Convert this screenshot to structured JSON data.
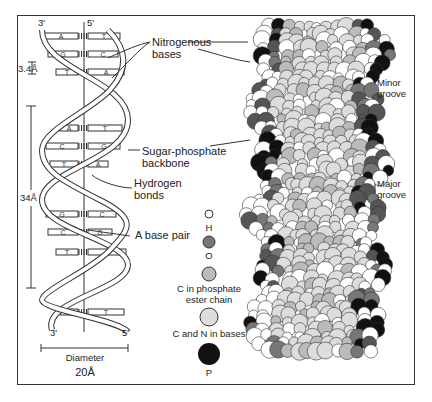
{
  "diagram": {
    "ladder_model": {
      "strand_ends_top": [
        "3'",
        "5'"
      ],
      "strand_ends_bottom": [
        "3'",
        "5'"
      ],
      "base_pairs": [
        {
          "left": "A",
          "right": "T"
        },
        {
          "left": "G",
          "right": "C"
        },
        {
          "left": "T",
          "right": "A"
        },
        {
          "left": "A",
          "right": "T"
        },
        {
          "left": "C",
          "right": "G"
        },
        {
          "left": "T",
          "right": "A"
        },
        {
          "left": "G",
          "right": "C"
        },
        {
          "left": "C",
          "right": "G"
        },
        {
          "left": "T",
          "right": "A"
        },
        {
          "left": "A",
          "right": "T"
        }
      ],
      "rise_label": "3.4Å",
      "pitch_label": "34Å",
      "diameter_label": "Diameter",
      "diameter_value": "20Å"
    },
    "callouts": {
      "nitrogenous_bases": "Nitrogenous bases",
      "nitrogenous_line1": "Nitrogenous",
      "nitrogenous_line2": "bases",
      "backbone_line1": "Sugar-phosphate",
      "backbone_line2": "backbone",
      "hbond_line1": "Hydrogen",
      "hbond_line2": "bonds",
      "base_pair": "A base pair"
    },
    "legend": [
      {
        "symbol": "H",
        "label": "H",
        "fill": "#ffffff"
      },
      {
        "symbol": "O",
        "label": "O",
        "fill": "#777777"
      },
      {
        "symbol": "C-phosphate",
        "label_line1": "C in phosphate",
        "label_line2": "ester chain",
        "fill": "#bbbbbb"
      },
      {
        "symbol": "C-N-bases",
        "label": "C and N in bases",
        "fill": "#dddddd"
      },
      {
        "symbol": "P",
        "label": "P",
        "fill": "#111111"
      }
    ],
    "space_filling_model": {
      "minor_groove_line1": "Minor",
      "minor_groove_line2": "groove",
      "major_groove_line1": "Major",
      "major_groove_line2": "groove"
    }
  }
}
